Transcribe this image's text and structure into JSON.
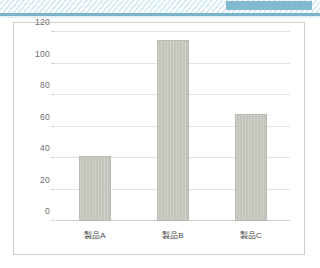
{
  "header": {
    "band_pattern": "diagonal-stripes",
    "accent_color": "#7cb6cc",
    "rule_color": "#79b4cb"
  },
  "panel": {
    "border_color": "#cfcfcf",
    "background": "#ffffff"
  },
  "chart_data": {
    "type": "bar",
    "title": "",
    "xlabel": "",
    "ylabel": "",
    "categories": [
      "製品A",
      "製品B",
      "製品C"
    ],
    "values": [
      41,
      115,
      68
    ],
    "ylim": [
      0,
      120
    ],
    "yticks": [
      0,
      20,
      40,
      60,
      80,
      100,
      120
    ],
    "ytick_labels": [
      "0",
      "20",
      "40",
      "60",
      "80",
      "100",
      "120"
    ],
    "grid": true,
    "legend": false,
    "bar_color": "#c3c4bb",
    "gridline_color": "#e2e2e2",
    "axis_label_color": "#6d6d6d"
  }
}
